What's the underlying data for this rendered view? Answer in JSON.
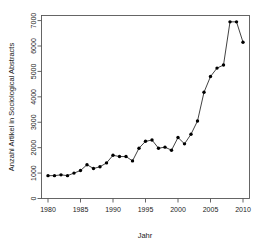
{
  "chart_data": {
    "type": "line",
    "title": "",
    "xlabel": "Jahr",
    "ylabel": "Anzahl Artikel in Sociological Abstracts",
    "xlim": [
      1979,
      2011
    ],
    "ylim": [
      0,
      7200
    ],
    "xticks": [
      1980,
      1985,
      1990,
      1995,
      2000,
      2005,
      2010
    ],
    "yticks": [
      0,
      1000,
      2000,
      3000,
      4000,
      5000,
      6000,
      7000
    ],
    "grid": false,
    "legend": null,
    "marker": "filled-circle",
    "x": [
      1980,
      1981,
      1982,
      1983,
      1984,
      1985,
      1986,
      1987,
      1988,
      1989,
      1990,
      1991,
      1992,
      1993,
      1994,
      1995,
      1996,
      1997,
      1998,
      1999,
      2000,
      2001,
      2002,
      2003,
      2004,
      2005,
      2006,
      2007,
      2008,
      2009,
      2010
    ],
    "values": [
      900,
      900,
      930,
      900,
      1000,
      1100,
      1330,
      1180,
      1250,
      1400,
      1700,
      1650,
      1650,
      1480,
      1980,
      2250,
      2300,
      1980,
      2020,
      1900,
      2400,
      2150,
      2530,
      3050,
      4180,
      4800,
      5130,
      5250,
      6950,
      6950,
      6150
    ],
    "series": [
      {
        "name": "Anzahl Artikel in Sociological Abstracts",
        "values": [
          900,
          900,
          930,
          900,
          1000,
          1100,
          1330,
          1180,
          1250,
          1400,
          1700,
          1650,
          1650,
          1480,
          1980,
          2250,
          2300,
          1980,
          2020,
          1900,
          2400,
          2150,
          2530,
          3050,
          4180,
          4800,
          5130,
          5250,
          6950,
          6950,
          6150
        ]
      }
    ],
    "colors": {
      "line": "#111111",
      "marker": "#000000",
      "axis": "#555555",
      "background": "#ffffff"
    }
  },
  "axes": {
    "x_tick_labels": [
      "1980",
      "1985",
      "1990",
      "1995",
      "2000",
      "2005",
      "2010"
    ],
    "y_tick_labels": [
      "0",
      "1000",
      "2000",
      "3000",
      "4000",
      "5000",
      "6000",
      "7000"
    ],
    "x_title": "Jahr",
    "y_title": "Anzahl Artikel in Sociological Abstracts"
  }
}
